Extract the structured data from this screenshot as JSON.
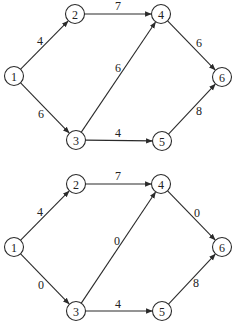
{
  "graphs": [
    {
      "id": "top",
      "nodes": [
        {
          "id": "1",
          "x": 14,
          "y": 76
        },
        {
          "id": "2",
          "x": 75,
          "y": 14
        },
        {
          "id": "3",
          "x": 76,
          "y": 140
        },
        {
          "id": "4",
          "x": 161,
          "y": 14
        },
        {
          "id": "5",
          "x": 162,
          "y": 141
        },
        {
          "id": "6",
          "x": 222,
          "y": 77
        }
      ],
      "edges": [
        {
          "from": "1",
          "to": "2",
          "weight": "4",
          "lx": 40,
          "ly": 41
        },
        {
          "from": "1",
          "to": "3",
          "weight": "6",
          "lx": 41,
          "ly": 114
        },
        {
          "from": "2",
          "to": "4",
          "weight": "7",
          "lx": 118,
          "ly": 6
        },
        {
          "from": "3",
          "to": "4",
          "weight": "6",
          "lx": 118,
          "ly": 68
        },
        {
          "from": "3",
          "to": "5",
          "weight": "4",
          "lx": 118,
          "ly": 133
        },
        {
          "from": "4",
          "to": "6",
          "weight": "6",
          "lx": 199,
          "ly": 43
        },
        {
          "from": "5",
          "to": "6",
          "weight": "8",
          "lx": 199,
          "ly": 111
        }
      ]
    },
    {
      "id": "bottom",
      "nodes": [
        {
          "id": "1",
          "x": 14,
          "y": 247
        },
        {
          "id": "2",
          "x": 76,
          "y": 184
        },
        {
          "id": "3",
          "x": 76,
          "y": 311
        },
        {
          "id": "4",
          "x": 161,
          "y": 184
        },
        {
          "id": "5",
          "x": 162,
          "y": 311
        },
        {
          "id": "6",
          "x": 222,
          "y": 247
        }
      ],
      "edges": [
        {
          "from": "1",
          "to": "2",
          "weight": "4",
          "lx": 40,
          "ly": 212
        },
        {
          "from": "1",
          "to": "3",
          "weight": "0",
          "lx": 41,
          "ly": 285
        },
        {
          "from": "2",
          "to": "4",
          "weight": "7",
          "lx": 118,
          "ly": 176
        },
        {
          "from": "3",
          "to": "4",
          "weight": "0",
          "lx": 117,
          "ly": 241
        },
        {
          "from": "3",
          "to": "5",
          "weight": "4",
          "lx": 118,
          "ly": 304
        },
        {
          "from": "4",
          "to": "6",
          "weight": "0",
          "lx": 197,
          "ly": 213
        },
        {
          "from": "5",
          "to": "6",
          "weight": "8",
          "lx": 196,
          "ly": 283
        }
      ]
    }
  ]
}
